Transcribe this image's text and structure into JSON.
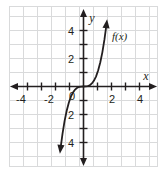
{
  "chart_data": {
    "type": "line",
    "title": "",
    "xlabel": "x",
    "ylabel": "y",
    "curve_label": "f(x)",
    "function": "y = x^3",
    "xlim": [
      -5,
      5
    ],
    "ylim": [
      -5.5,
      5
    ],
    "grid": true,
    "legend_position": "inline-right-of-curve",
    "x_tick_labels": [
      "-4",
      "-2",
      "2",
      "4"
    ],
    "x_tick_values": [
      -4,
      -2,
      2,
      4
    ],
    "y_tick_labels": [
      "4",
      "2",
      "2",
      "4"
    ],
    "y_tick_values": [
      4,
      2,
      -2,
      -4
    ],
    "origin_label": "0",
    "minor_tick_step": 1,
    "grid_step": 1,
    "x": [
      -1.65,
      -1.5,
      -1.35,
      -1.2,
      -1.05,
      -0.9,
      -0.75,
      -0.6,
      -0.45,
      -0.3,
      -0.15,
      0,
      0.15,
      0.3,
      0.45,
      0.6,
      0.75,
      0.9,
      1.05,
      1.2,
      1.35,
      1.5,
      1.65
    ],
    "y": [
      -4.49,
      -3.38,
      -2.46,
      -1.73,
      -1.16,
      -0.73,
      -0.42,
      -0.22,
      -0.09,
      -0.03,
      -0.003,
      0,
      0.003,
      0.03,
      0.09,
      0.22,
      0.42,
      0.73,
      1.16,
      1.73,
      2.46,
      3.38,
      4.49
    ]
  },
  "colors": {
    "grid": "#d9dadb",
    "axis": "#231f20",
    "curve": "#231f20",
    "background": "#ffffff"
  }
}
